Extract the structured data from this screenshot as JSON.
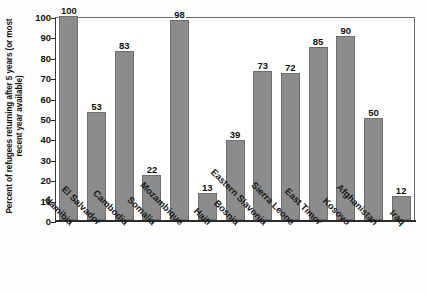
{
  "chart_data": {
    "type": "bar",
    "title": "",
    "xlabel": "",
    "ylabel": "Percent of refugees returning after 5 years (or most recent year available)",
    "ylim": [
      0,
      100
    ],
    "yticks": [
      0,
      10,
      20,
      30,
      40,
      50,
      60,
      70,
      80,
      90,
      100
    ],
    "grid": false,
    "legend": "none",
    "bar_color": "#8c8c8c",
    "categories": [
      "Namibia",
      "El Salvador",
      "Cambodia",
      "Somalia",
      "Mozambique",
      "Haiti",
      "Bosnia",
      "Eastern Slavonia",
      "Sierra Leone",
      "East Timor",
      "Kosovo",
      "Afghanistan",
      "Iraq"
    ],
    "values": [
      100,
      53,
      83,
      22,
      98,
      13,
      39,
      73,
      72,
      85,
      90,
      50,
      12
    ],
    "value_labels": [
      "100",
      "53",
      "83",
      "22",
      "98",
      "13",
      "39",
      "73",
      "72",
      "85",
      "90",
      "50",
      "12"
    ]
  }
}
